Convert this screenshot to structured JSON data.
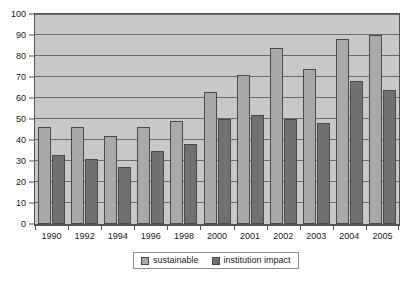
{
  "chart_data": {
    "type": "bar",
    "title": "",
    "subtitle": "",
    "xlabel": "",
    "ylabel": "",
    "categories": [
      "1990",
      "1992",
      "1994",
      "1996",
      "1998",
      "2000",
      "2001",
      "2002",
      "2003",
      "2004",
      "2005"
    ],
    "series": [
      {
        "name": "sustainable",
        "color": "#a9a9a9",
        "values": [
          46,
          46,
          42,
          46,
          49,
          63,
          71,
          84,
          74,
          88,
          90
        ]
      },
      {
        "name": "institution impact",
        "color": "#717171",
        "values": [
          33,
          31,
          27,
          35,
          38,
          50,
          52,
          50,
          48,
          68,
          64
        ]
      }
    ],
    "ylim": [
      0,
      100
    ],
    "y_ticks": [
      0,
      10,
      20,
      30,
      40,
      50,
      60,
      70,
      80,
      90,
      100
    ],
    "y_tick_labels": [
      "0",
      "10",
      "20",
      "30",
      "40",
      "50",
      "60",
      "70",
      "80",
      "90",
      "100"
    ],
    "grid": true,
    "grid_axis": "y",
    "legend_position": "bottom",
    "plot_background": "#c8c8c8",
    "figure_background": "#ffffff",
    "axis_color": "#555555",
    "gridline_color": "#6b6b6b"
  },
  "legend": {
    "items": [
      {
        "label": "sustainable"
      },
      {
        "label": "institution impact"
      }
    ]
  }
}
